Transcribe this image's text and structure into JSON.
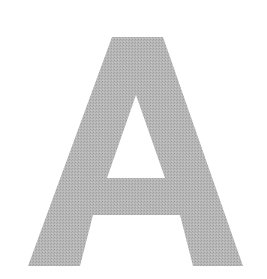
{
  "image": {
    "glyph": "A",
    "fill_color": "#b3b3b3",
    "halftone_dot_color": "#9e9e9e",
    "background_color": "#ffffff"
  }
}
